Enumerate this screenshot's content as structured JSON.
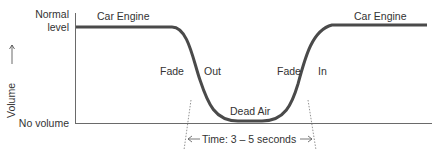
{
  "diagram": {
    "y_axis_label": "Volume",
    "y_axis_arrow": "→",
    "y_top_label_line1": "Normal",
    "y_top_label_line2": "level",
    "y_bottom_label": "No volume",
    "left_segment_label": "Car Engine",
    "right_segment_label": "Car Engine",
    "fade_out_label_left": "Fade",
    "fade_out_label_right": "Out",
    "fade_in_label_left": "Fade",
    "fade_in_label_right": "In",
    "bottom_label": "Dead Air",
    "time_label": "Time: 3 – 5 seconds",
    "colors": {
      "curve": "#4a4a4a",
      "axis": "#6a6a6a",
      "text": "#333333"
    }
  }
}
